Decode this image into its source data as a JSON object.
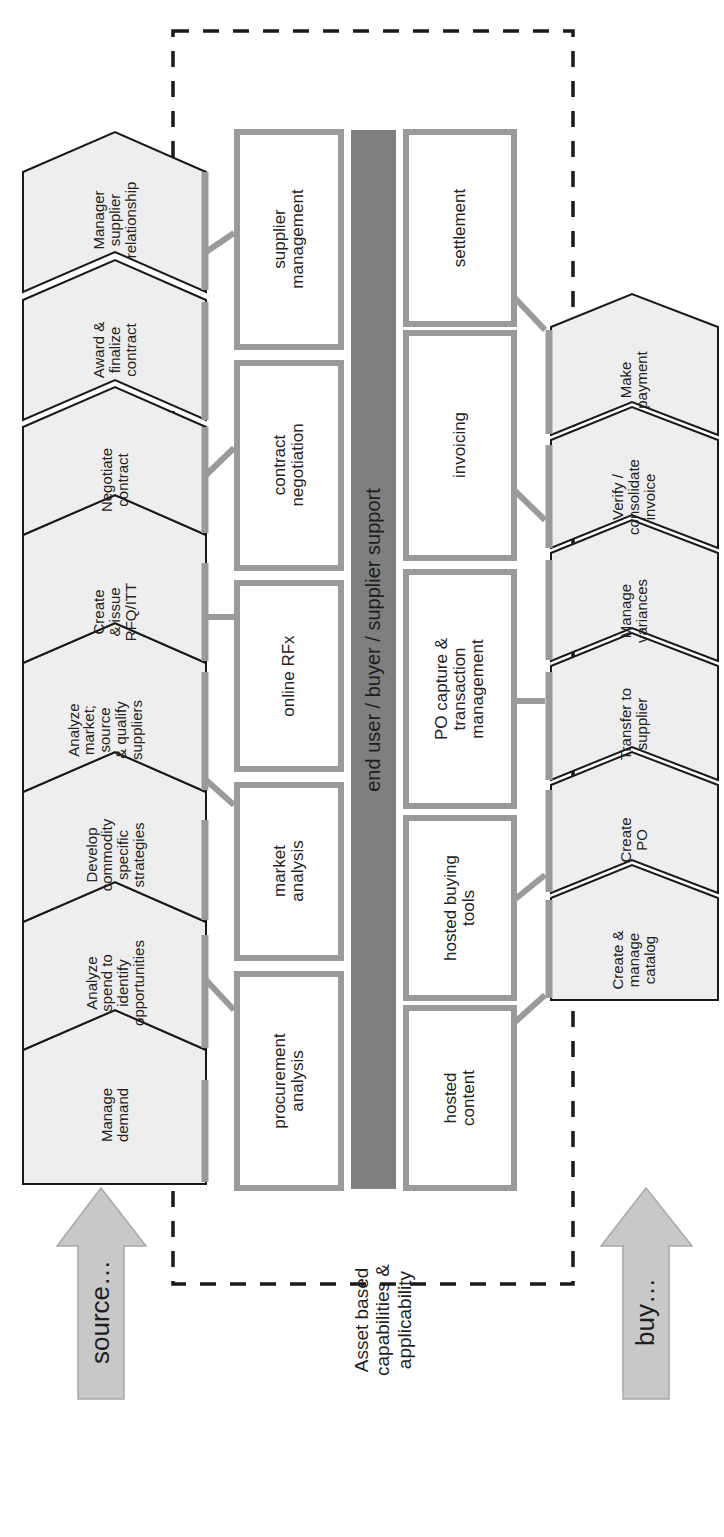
{
  "diagram": {
    "orientation": "rotated-90-ccw",
    "colors": {
      "chevron_fill": "#eeeeee",
      "chevron_stroke": "#1a1a1a",
      "box_border": "#9a9a9a",
      "box_fill": "#ffffff",
      "support_bar": "#7f7f7f",
      "connector": "#9a9a9a",
      "arrow_fill": "#c8c8c8",
      "dashed_border": "#1a1a1a"
    },
    "source_arrow": {
      "label": "source…"
    },
    "buy_arrow": {
      "label": "buy…"
    },
    "asset_label": "Asset based\ncapabilities &\napplicability",
    "support_bar": {
      "label": "end user / buyer / supplier support"
    },
    "source_steps": [
      {
        "label": "Manage\ndemand"
      },
      {
        "label": "Analyze\nspend to\nidentify\nopportunities"
      },
      {
        "label": "Develop\ncommodity\nspecific\nstrategies"
      },
      {
        "label": "Analyze\nmarket;\nsource\n& qualify\nsuppliers"
      },
      {
        "label": "Create\n& issue\nRFQ/ITT"
      },
      {
        "label": "Negotiate\ncontract"
      },
      {
        "label": "Award &\nfinalize\ncontract"
      },
      {
        "label": "Manager\nsupplier\nrelationship"
      }
    ],
    "source_capabilities": [
      {
        "label": "procurement\nanalysis"
      },
      {
        "label": "market\nanalysis"
      },
      {
        "label": "online RFx"
      },
      {
        "label": "contract\nnegotiation"
      },
      {
        "label": "supplier\nmanagement"
      }
    ],
    "buy_capabilities": [
      {
        "label": "hosted\ncontent"
      },
      {
        "label": "hosted buying\ntools"
      },
      {
        "label": "PO capture &\ntransaction\nmanagement"
      },
      {
        "label": "invoicing"
      },
      {
        "label": "settlement"
      }
    ],
    "buy_steps": [
      {
        "label": "Create &\nmanage\ncatalog"
      },
      {
        "label": "Create\nPO"
      },
      {
        "label": "Transfer to\nsupplier"
      },
      {
        "label": "Manage\nvariances"
      },
      {
        "label": "Verify /\nconsolidate\ninvoice"
      },
      {
        "label": "Make\npayment"
      }
    ]
  }
}
